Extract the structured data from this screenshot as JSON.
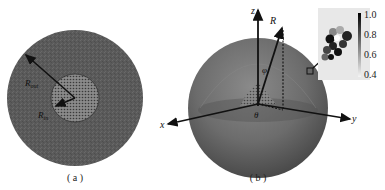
{
  "panel_a": {
    "caption": "( a )",
    "outer_label": "R",
    "outer_sub": "out",
    "inner_label": "R",
    "inner_sub": "in"
  },
  "panel_b": {
    "caption": "( b )",
    "axes": {
      "z": "z",
      "x": "x",
      "y": "y"
    },
    "radius_label": "R",
    "polar_angle": "φ",
    "azimuth_angle": "θ",
    "colorbar": {
      "ticks": [
        "1.0",
        "0.8",
        "0.6",
        "0.4"
      ],
      "min": 0.4,
      "max": 1.0
    }
  },
  "colors": {
    "outer_sphere": "#5e5e5e",
    "inner_core": "#7a7a7a",
    "arrow": "#111111",
    "inset_bg": "#e8e8e8"
  }
}
